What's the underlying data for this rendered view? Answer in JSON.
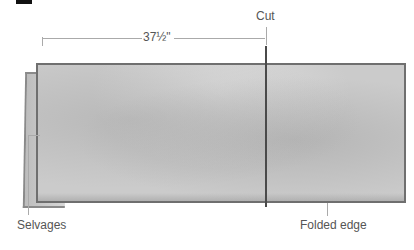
{
  "diagram": {
    "labels": {
      "measurement": "37½\"",
      "cut": "Cut",
      "selvages": "Selvages",
      "folded_edge": "Folded edge"
    },
    "colors": {
      "fabric": "#cbcbcb",
      "fabric_border": "#6f6f6f",
      "cut_line": "#4a4a4a",
      "leader_lines": "#aaaaaa",
      "text": "#555555"
    }
  }
}
